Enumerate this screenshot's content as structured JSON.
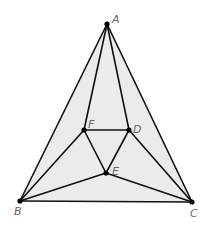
{
  "diagram": {
    "type": "geometry-triangle-subdivision",
    "fill_color": "#ebebeb",
    "stroke_color": "#111111",
    "points": {
      "A": {
        "label": "A",
        "x": 107,
        "y": 24
      },
      "B": {
        "label": "B",
        "x": 20,
        "y": 201
      },
      "C": {
        "label": "C",
        "x": 192,
        "y": 202
      },
      "D": {
        "label": "D",
        "x": 129,
        "y": 130
      },
      "E": {
        "label": "E",
        "x": 106,
        "y": 173
      },
      "F": {
        "label": "F",
        "x": 84,
        "y": 130
      }
    },
    "segments": [
      [
        "A",
        "B"
      ],
      [
        "A",
        "C"
      ],
      [
        "B",
        "C"
      ],
      [
        "A",
        "F"
      ],
      [
        "A",
        "D"
      ],
      [
        "F",
        "D"
      ],
      [
        "F",
        "E"
      ],
      [
        "D",
        "E"
      ],
      [
        "B",
        "F"
      ],
      [
        "B",
        "E"
      ],
      [
        "C",
        "D"
      ],
      [
        "C",
        "E"
      ]
    ]
  }
}
